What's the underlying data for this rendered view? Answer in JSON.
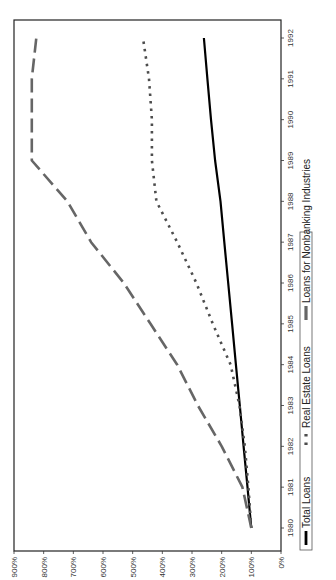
{
  "chart_data": {
    "type": "line",
    "orientation": "rotated-90-ccw",
    "title": "",
    "xlabel": "",
    "ylabel": "",
    "x": [
      1980,
      1981,
      1982,
      1983,
      1984,
      1985,
      1986,
      1987,
      1988,
      1989,
      1990,
      1991,
      1992
    ],
    "x_tick_labels": [
      "1980",
      "1981",
      "1982",
      "1983",
      "1984",
      "1985",
      "1986",
      "1987",
      "1988",
      "1989",
      "1990",
      "1991",
      "1992"
    ],
    "y_tick_labels": [
      "0%",
      "100%",
      "200%",
      "300%",
      "400%",
      "500%",
      "600%",
      "700%",
      "800%",
      "900%"
    ],
    "ylim": [
      0,
      900
    ],
    "grid": false,
    "legend_position": "bottom",
    "series": [
      {
        "name": "Total Loans",
        "style": "solid",
        "color": "#000000",
        "values": [
          100,
          113,
          126,
          139,
          152,
          165,
          178,
          191,
          204,
          222,
          236,
          248,
          260
        ]
      },
      {
        "name": "Real Estate Loans",
        "style": "dotted",
        "color": "#4d4d4d",
        "values": [
          100,
          110,
          122,
          140,
          170,
          230,
          285,
          350,
          420,
          435,
          435,
          445,
          465
        ]
      },
      {
        "name": "Loans for Nonbanking Industries",
        "style": "dashed",
        "color": "#666666",
        "values": [
          100,
          130,
          200,
          280,
          350,
          440,
          530,
          640,
          720,
          840,
          840,
          840,
          825
        ]
      }
    ]
  },
  "legend": {
    "items": [
      {
        "label": "Total Loans"
      },
      {
        "label": "Real Estate Loans"
      },
      {
        "label": "Loans for Nonbanking Industries"
      }
    ]
  }
}
